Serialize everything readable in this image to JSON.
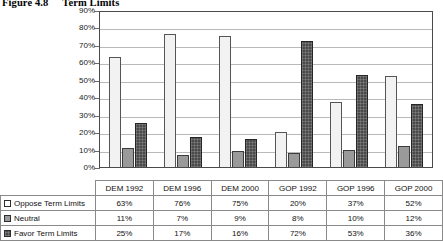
{
  "figure": {
    "number": "Figure 4.8",
    "title": "Term Limits"
  },
  "chart_data": {
    "type": "bar",
    "title": "Term Limits",
    "xlabel": "",
    "ylabel": "",
    "ylim": [
      0,
      90
    ],
    "ytick_labels": [
      "90%",
      "80%",
      "70%",
      "60%",
      "50%",
      "40%",
      "30%",
      "20%",
      "10%",
      "0%"
    ],
    "ytick_values": [
      90,
      80,
      70,
      60,
      50,
      40,
      30,
      20,
      10,
      0
    ],
    "grid": true,
    "legend_position": "table-below",
    "categories": [
      "DEM 1992",
      "DEM 1996",
      "DEM 2000",
      "GOP 1992",
      "GOP 1996",
      "GOP 2000"
    ],
    "series": [
      {
        "name": "Oppose Term Limits",
        "swatch": "white",
        "values": [
          63,
          76,
          75,
          20,
          37,
          52
        ],
        "labels": [
          "63%",
          "76%",
          "75%",
          "20%",
          "37%",
          "52%"
        ]
      },
      {
        "name": "Neutral",
        "swatch": "gray",
        "values": [
          11,
          7,
          9,
          8,
          10,
          12
        ],
        "labels": [
          "11%",
          "7%",
          "9%",
          "8%",
          "10%",
          "12%"
        ]
      },
      {
        "name": "Favor Term Limits",
        "swatch": "dark-hatch",
        "values": [
          25,
          17,
          16,
          72,
          53,
          36
        ],
        "labels": [
          "25%",
          "17%",
          "16%",
          "72%",
          "53%",
          "36%"
        ]
      }
    ]
  },
  "colors": {
    "oppose": "#f2f2f2",
    "neutral": "#9a9a9a",
    "favor": "#4a4a4a",
    "gridline": "#b9b9b9",
    "axis": "#4a4a4a"
  }
}
